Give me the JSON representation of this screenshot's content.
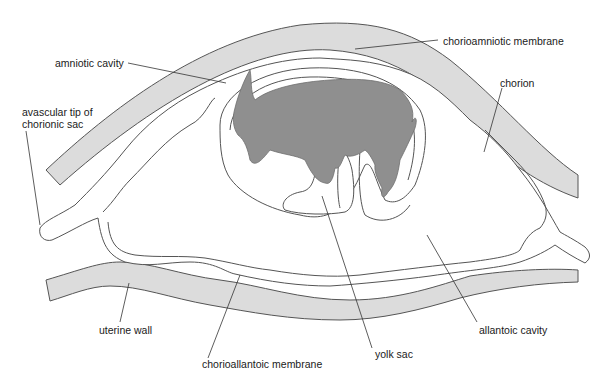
{
  "diagram": {
    "colors": {
      "uterine_wall_fill": "#dcdcdc",
      "fetus_fill": "#8f8f8f",
      "outline": "#555555",
      "background": "#ffffff"
    },
    "labels": {
      "amniotic_cavity": "amniotic cavity",
      "chorioamniotic_membrane": "chorioamniotic membrane",
      "chorion": "chorion",
      "avascular_tip_line1": "avascular tip of",
      "avascular_tip_line2": "chorionic sac",
      "uterine_wall": "uterine wall",
      "chorioallantoic_membrane": "chorioallantoic membrane",
      "yolk_sac": "yolk sac",
      "allantoic_cavity": "allantoic cavity"
    }
  }
}
